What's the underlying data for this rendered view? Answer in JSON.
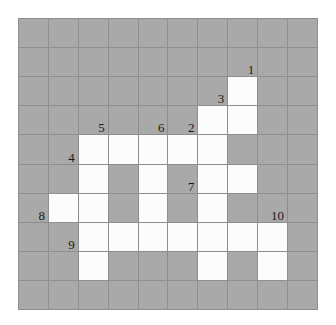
{
  "puzzle": {
    "title": "Numbered Grid Puzzle",
    "rows": 10,
    "cols": 10,
    "colors": {
      "shaded": "#a9a9a9",
      "open": "#fcfcfc",
      "gridline": "#8e8e8e",
      "clue_text": "#1a1a1a",
      "background": "#ffffff"
    },
    "legend": {
      "shaded_label": "shaded",
      "open_label": "open"
    },
    "grid": [
      [
        "shaded",
        "shaded",
        "shaded",
        "shaded",
        "shaded",
        "shaded",
        "shaded",
        "shaded",
        "shaded",
        "shaded"
      ],
      [
        "shaded",
        "shaded",
        "shaded",
        "shaded",
        "shaded",
        "shaded",
        "shaded",
        "shaded",
        "shaded",
        "shaded"
      ],
      [
        "shaded",
        "shaded",
        "shaded",
        "shaded",
        "shaded",
        "shaded",
        "shaded",
        "open",
        "shaded",
        "shaded"
      ],
      [
        "shaded",
        "shaded",
        "shaded",
        "shaded",
        "shaded",
        "shaded",
        "open",
        "open",
        "shaded",
        "shaded"
      ],
      [
        "shaded",
        "shaded",
        "open",
        "open",
        "open",
        "open",
        "open",
        "shaded",
        "shaded",
        "shaded"
      ],
      [
        "shaded",
        "shaded",
        "open",
        "shaded",
        "open",
        "shaded",
        "open",
        "open",
        "shaded",
        "shaded"
      ],
      [
        "shaded",
        "open",
        "open",
        "shaded",
        "open",
        "shaded",
        "open",
        "shaded",
        "shaded",
        "shaded"
      ],
      [
        "shaded",
        "shaded",
        "open",
        "open",
        "open",
        "open",
        "open",
        "open",
        "open",
        "shaded"
      ],
      [
        "shaded",
        "shaded",
        "open",
        "shaded",
        "shaded",
        "shaded",
        "open",
        "shaded",
        "open",
        "shaded"
      ],
      [
        "shaded",
        "shaded",
        "shaded",
        "shaded",
        "shaded",
        "shaded",
        "shaded",
        "shaded",
        "shaded",
        "shaded"
      ]
    ],
    "clues": [
      {
        "number": "1",
        "row": 1,
        "col": 7
      },
      {
        "number": "3",
        "row": 2,
        "col": 6
      },
      {
        "number": "5",
        "row": 3,
        "col": 2
      },
      {
        "number": "6",
        "row": 3,
        "col": 4
      },
      {
        "number": "2",
        "row": 3,
        "col": 5
      },
      {
        "number": "4",
        "row": 4,
        "col": 1
      },
      {
        "number": "7",
        "row": 5,
        "col": 5
      },
      {
        "number": "8",
        "row": 6,
        "col": 0
      },
      {
        "number": "10",
        "row": 6,
        "col": 8
      },
      {
        "number": "9",
        "row": 7,
        "col": 1
      }
    ]
  }
}
